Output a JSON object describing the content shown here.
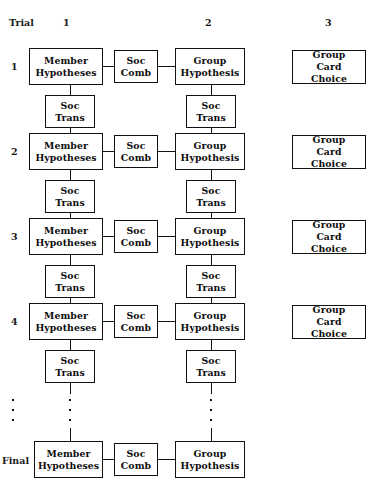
{
  "diagram": {
    "row_header_label": "Trial",
    "column_headers": [
      {
        "label": "1",
        "x": 63
      },
      {
        "label": "2",
        "x": 205
      },
      {
        "label": "3",
        "x": 325
      }
    ],
    "row_labels": [
      {
        "label": "1"
      },
      {
        "label": "2"
      },
      {
        "label": "3"
      },
      {
        "label": "4"
      },
      {
        "label": "Final"
      }
    ],
    "node_labels": {
      "member_hypotheses": "Member\nHypotheses",
      "member_hypotheses_line1": "Member",
      "member_hypotheses_line2": "Hypotheses",
      "soc_comb_line1": "Soc",
      "soc_comb_line2": "Comb",
      "group_hypothesis_line1": "Group",
      "group_hypothesis_line2": "Hypothesis",
      "group_card_choice_line1": "Group",
      "group_card_choice_line2": "Card Choice",
      "soc_trans_line1": "Soc",
      "soc_trans_line2": "Trans"
    },
    "colors": {
      "stroke": "#111111",
      "text": "#0d0d0d",
      "background": "#ffffff"
    },
    "ellipsis": {
      "dot_count": 3,
      "columns": [
        "left-margin",
        "member-column",
        "group-column"
      ]
    }
  }
}
